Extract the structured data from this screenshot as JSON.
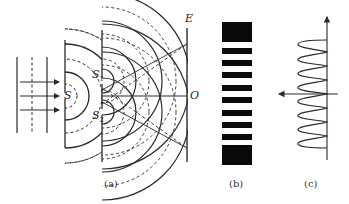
{
  "figure": {
    "panels": [
      {
        "id": "a",
        "caption": "(a)",
        "description": "Double-slit interference setup with plane incident waves, single slit S, double slits S1 and S2, and screen E",
        "labels": {
          "source": "S",
          "slit1": "S",
          "slit1_sub": "1",
          "slit2": "S",
          "slit2_sub": "2",
          "screen": "E",
          "center": "O"
        }
      },
      {
        "id": "b",
        "caption": "(b)",
        "description": "Interference fringe pattern (alternating dark and bright bands)",
        "fringe_count_dark": 10
      },
      {
        "id": "c",
        "caption": "(c)",
        "description": "Intensity distribution curve along the screen",
        "peak_count": 8
      }
    ],
    "colors": {
      "line": "#2a2a2a",
      "fringe": "#0a0a0a",
      "background": "#ffffff"
    }
  }
}
